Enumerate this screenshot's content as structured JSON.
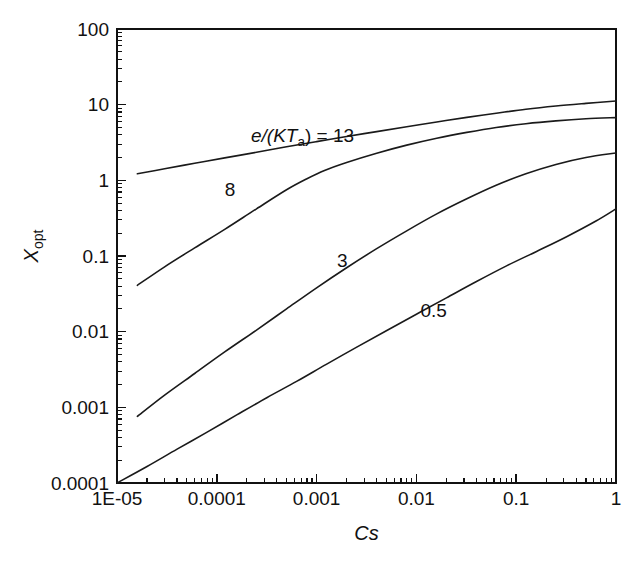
{
  "chart_data": {
    "type": "line",
    "title": "",
    "xlabel": "Cs",
    "ylabel": "X_opt",
    "xlabel_display": "Cs",
    "ylabel_main": "X",
    "ylabel_sub": "opt",
    "xscale": "log",
    "yscale": "log",
    "xlim": [
      1e-05,
      1
    ],
    "ylim": [
      0.0001,
      100
    ],
    "grid": false,
    "legend_position": "inline-annotations",
    "xtick_labels": [
      "1E-05",
      "0.0001",
      "0.001",
      "0.01",
      "0.1",
      "1"
    ],
    "xtick_values": [
      1e-05,
      0.0001,
      0.001,
      0.01,
      0.1,
      1
    ],
    "ytick_labels": [
      "100",
      "10",
      "1",
      "0.1",
      "0.01",
      "0.001",
      "0.0001"
    ],
    "ytick_values": [
      100,
      10,
      1,
      0.1,
      0.01,
      0.001,
      0.0001
    ],
    "annotations": [
      {
        "text_prefix": "e",
        "text": "e/(KT",
        "sub": "a",
        "text_suffix": ") = 13",
        "x": 0.00022,
        "y": 3.2
      },
      {
        "text": "8",
        "x": 0.00012,
        "y": 0.62
      },
      {
        "text": "3",
        "x": 0.0016,
        "y": 0.072
      },
      {
        "text": "0.5",
        "x": 0.011,
        "y": 0.0155
      }
    ],
    "series": [
      {
        "name": "e/(KTa) = 13",
        "label": "13",
        "x": [
          1.6e-05,
          3e-05,
          6e-05,
          0.00012,
          0.00025,
          0.0005,
          0.001,
          0.002,
          0.004,
          0.008,
          0.016,
          0.032,
          0.063,
          0.125,
          0.25,
          0.5,
          1.0
        ],
        "y": [
          1.22,
          1.42,
          1.68,
          1.98,
          2.35,
          2.78,
          3.25,
          3.8,
          4.4,
          5.1,
          5.9,
          6.8,
          7.7,
          8.7,
          9.6,
          10.4,
          11.2
        ]
      },
      {
        "name": "e/(KTa) = 8",
        "label": "8",
        "x": [
          1.6e-05,
          3e-05,
          6e-05,
          0.00012,
          0.00025,
          0.0005,
          0.0008,
          0.0012,
          0.002,
          0.004,
          0.008,
          0.016,
          0.032,
          0.063,
          0.125,
          0.25,
          0.5,
          1.0
        ],
        "y": [
          0.041,
          0.072,
          0.128,
          0.225,
          0.42,
          0.75,
          1.05,
          1.35,
          1.72,
          2.28,
          2.92,
          3.6,
          4.3,
          5.0,
          5.6,
          6.1,
          6.5,
          6.75
        ]
      },
      {
        "name": "e/(KTa) = 3",
        "label": "3",
        "x": [
          1.6e-05,
          3e-05,
          6e-05,
          0.00012,
          0.00025,
          0.0005,
          0.001,
          0.002,
          0.004,
          0.008,
          0.016,
          0.032,
          0.063,
          0.125,
          0.25,
          0.5,
          1.0
        ],
        "y": [
          0.00076,
          0.00145,
          0.0028,
          0.0054,
          0.0105,
          0.02,
          0.038,
          0.07,
          0.125,
          0.215,
          0.36,
          0.57,
          0.86,
          1.22,
          1.62,
          2.0,
          2.3
        ]
      },
      {
        "name": "e/(KTa) = 0.5",
        "label": "0.5",
        "x": [
          1e-05,
          2e-05,
          4e-05,
          8e-05,
          0.00016,
          0.00032,
          0.00063,
          0.00125,
          0.0025,
          0.005,
          0.01,
          0.02,
          0.04,
          0.08,
          0.16,
          0.32,
          0.63,
          1.0
        ],
        "y": [
          0.0001,
          0.000165,
          0.00028,
          0.00047,
          0.0008,
          0.00135,
          0.0022,
          0.0037,
          0.0062,
          0.0103,
          0.017,
          0.028,
          0.046,
          0.074,
          0.115,
          0.18,
          0.29,
          0.42
        ]
      }
    ]
  },
  "plot_box": {
    "left": 117,
    "right": 616,
    "top": 29,
    "bottom": 483
  },
  "colors": {
    "axis": "#111111",
    "curve": "#1a1a1a",
    "background": "#ffffff"
  }
}
